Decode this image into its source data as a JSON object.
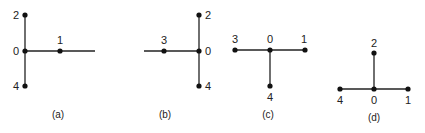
{
  "figure": {
    "panels": [
      {
        "id": "a",
        "caption": "(a)",
        "caption_pos": [
          58,
          118
        ],
        "edges": [
          [
            25,
            15,
            25,
            86
          ],
          [
            25,
            51,
            95,
            51
          ]
        ],
        "nodes": [
          {
            "label": "2",
            "x": 25,
            "y": 15,
            "lx": 16,
            "ly": 19,
            "anchor": "middle"
          },
          {
            "label": "0",
            "x": 25,
            "y": 51,
            "lx": 16,
            "ly": 55,
            "anchor": "middle"
          },
          {
            "label": "1",
            "x": 60,
            "y": 51,
            "lx": 60,
            "ly": 44,
            "anchor": "middle"
          },
          {
            "label": "4",
            "x": 25,
            "y": 86,
            "lx": 16,
            "ly": 90,
            "anchor": "middle"
          }
        ]
      },
      {
        "id": "b",
        "caption": "(b)",
        "caption_pos": [
          165,
          118
        ],
        "edges": [
          [
            199,
            15,
            199,
            86
          ],
          [
            144,
            51,
            199,
            51
          ]
        ],
        "nodes": [
          {
            "label": "2",
            "x": 199,
            "y": 15,
            "lx": 208,
            "ly": 19,
            "anchor": "middle"
          },
          {
            "label": "3",
            "x": 164,
            "y": 51,
            "lx": 164,
            "ly": 44,
            "anchor": "middle"
          },
          {
            "label": "0",
            "x": 199,
            "y": 51,
            "lx": 208,
            "ly": 55,
            "anchor": "middle"
          },
          {
            "label": "4",
            "x": 199,
            "y": 86,
            "lx": 208,
            "ly": 90,
            "anchor": "middle"
          }
        ]
      },
      {
        "id": "c",
        "caption": "(c)",
        "caption_pos": [
          268,
          118
        ],
        "edges": [
          [
            235,
            50,
            305,
            50
          ],
          [
            270,
            50,
            270,
            86
          ]
        ],
        "nodes": [
          {
            "label": "3",
            "x": 235,
            "y": 50,
            "lx": 235,
            "ly": 43,
            "anchor": "middle"
          },
          {
            "label": "0",
            "x": 270,
            "y": 50,
            "lx": 270,
            "ly": 43,
            "anchor": "middle"
          },
          {
            "label": "1",
            "x": 305,
            "y": 50,
            "lx": 304,
            "ly": 43,
            "anchor": "middle"
          },
          {
            "label": "4",
            "x": 270,
            "y": 86,
            "lx": 270,
            "ly": 101,
            "anchor": "middle"
          }
        ]
      },
      {
        "id": "d",
        "caption": "(d)",
        "caption_pos": [
          374,
          121
        ],
        "edges": [
          [
            340,
            89,
            408,
            89
          ],
          [
            374,
            53,
            374,
            89
          ]
        ],
        "nodes": [
          {
            "label": "2",
            "x": 374,
            "y": 53,
            "lx": 374,
            "ly": 47,
            "anchor": "middle"
          },
          {
            "label": "4",
            "x": 340,
            "y": 89,
            "lx": 340,
            "ly": 104,
            "anchor": "middle"
          },
          {
            "label": "0",
            "x": 374,
            "y": 89,
            "lx": 374,
            "ly": 104,
            "anchor": "middle"
          },
          {
            "label": "1",
            "x": 408,
            "y": 89,
            "lx": 408,
            "ly": 104,
            "anchor": "middle"
          }
        ]
      }
    ]
  }
}
